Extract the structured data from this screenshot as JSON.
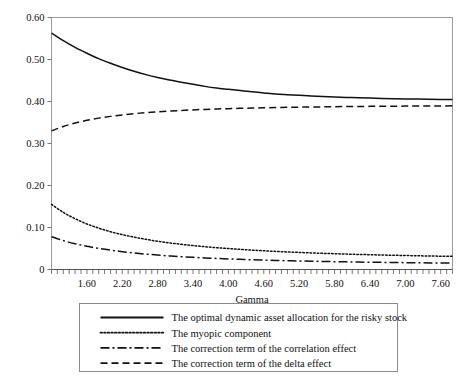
{
  "chart_data": {
    "type": "line",
    "title": "",
    "xlabel": "Gamma",
    "ylabel": "",
    "xlim": [
      1.0,
      7.8
    ],
    "ylim": [
      0.0,
      0.6
    ],
    "grid": false,
    "legend_position": "below-plot",
    "x_tick_labels": [
      "1.60",
      "2.20",
      "2.80",
      "3.40",
      "4.00",
      "4.60",
      "5.20",
      "5.80",
      "6.40",
      "7.00",
      "7.60"
    ],
    "x_tick_values": [
      1.6,
      2.2,
      2.8,
      3.4,
      4.0,
      4.6,
      5.2,
      5.8,
      6.4,
      7.0,
      7.6
    ],
    "x_minor_tick_step": 0.1,
    "y_tick_labels": [
      "0",
      "0.10",
      "0.20",
      "0.30",
      "0.40",
      "0.50",
      "0.60"
    ],
    "y_tick_values": [
      0,
      0.1,
      0.2,
      0.3,
      0.4,
      0.5,
      0.6
    ],
    "x": [
      1.0,
      1.2,
      1.4,
      1.6,
      1.8,
      2.0,
      2.2,
      2.4,
      2.6,
      2.8,
      3.0,
      3.2,
      3.4,
      3.6,
      3.8,
      4.0,
      4.2,
      4.4,
      4.6,
      4.8,
      5.0,
      5.2,
      5.4,
      5.6,
      5.8,
      6.0,
      6.2,
      6.4,
      6.6,
      6.8,
      7.0,
      7.2,
      7.4,
      7.6,
      7.8
    ],
    "series": [
      {
        "name": "The optimal dynamic asset allocation for the risky stock",
        "style": "solid",
        "color": "#111111",
        "values": [
          0.563,
          0.545,
          0.529,
          0.515,
          0.502,
          0.491,
          0.481,
          0.472,
          0.464,
          0.457,
          0.451,
          0.446,
          0.441,
          0.436,
          0.432,
          0.429,
          0.426,
          0.423,
          0.4205,
          0.418,
          0.4163,
          0.4147,
          0.4133,
          0.412,
          0.4108,
          0.4098,
          0.4089,
          0.4081,
          0.4074,
          0.4068,
          0.4062,
          0.4057,
          0.4053,
          0.4049,
          0.4046
        ]
      },
      {
        "name": "The myopic component",
        "style": "dotted",
        "color": "#111111",
        "values": [
          0.155,
          0.136,
          0.121,
          0.1085,
          0.0985,
          0.09,
          0.083,
          0.077,
          0.0718,
          0.0673,
          0.0634,
          0.06,
          0.057,
          0.0543,
          0.0519,
          0.0498,
          0.0479,
          0.0461,
          0.0446,
          0.0431,
          0.0418,
          0.0406,
          0.0395,
          0.0385,
          0.0376,
          0.0367,
          0.0359,
          0.0352,
          0.0345,
          0.0339,
          0.0333,
          0.0327,
          0.0322,
          0.0317,
          0.0313
        ]
      },
      {
        "name": "The correction term of the correlation effect",
        "style": "dash-dot",
        "color": "#111111",
        "values": [
          0.078,
          0.0688,
          0.0614,
          0.0553,
          0.0503,
          0.0461,
          0.0425,
          0.0394,
          0.0367,
          0.0344,
          0.0324,
          0.0306,
          0.029,
          0.0276,
          0.0263,
          0.0252,
          0.0242,
          0.0232,
          0.0224,
          0.0216,
          0.0209,
          0.0203,
          0.0197,
          0.0191,
          0.0186,
          0.0182,
          0.0177,
          0.0173,
          0.017,
          0.0166,
          0.0163,
          0.016,
          0.0157,
          0.0155,
          0.0152
        ]
      },
      {
        "name": "The correction term of the delta effect",
        "style": "dashed",
        "color": "#111111",
        "values": [
          0.33,
          0.3405,
          0.3487,
          0.3552,
          0.3604,
          0.3646,
          0.3681,
          0.371,
          0.3734,
          0.3755,
          0.3772,
          0.3787,
          0.38,
          0.3812,
          0.3821,
          0.383,
          0.3838,
          0.3844,
          0.385,
          0.3856,
          0.3861,
          0.3865,
          0.3869,
          0.3872,
          0.3876,
          0.3879,
          0.3881,
          0.3884,
          0.3886,
          0.3888,
          0.389,
          0.3892,
          0.3894,
          0.3895,
          0.3897
        ]
      }
    ]
  },
  "legend": {
    "items": [
      {
        "label": "The optimal dynamic asset allocation for the risky stock",
        "style": "solid"
      },
      {
        "label": "The myopic component",
        "style": "dotted"
      },
      {
        "label": "The correction term of the correlation effect",
        "style": "dash-dot"
      },
      {
        "label": "The correction term of the delta effect",
        "style": "dashed"
      }
    ]
  }
}
